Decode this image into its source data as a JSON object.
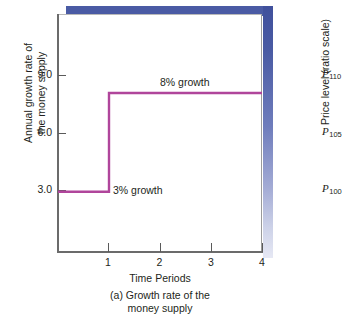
{
  "chart_data": {
    "type": "line",
    "title": "",
    "caption": "(a) Growth rate of the\nmoney supply",
    "caption_line1": "(a) Growth rate of the",
    "caption_line2": "money supply",
    "xlabel": "Time Periods",
    "ylabel_line1": "Annual growth rate of",
    "ylabel_line2": "the money supply",
    "ylabel": "Annual growth rate of the money supply",
    "right_axis_label": "Price level (ratio scale)",
    "xlim": [
      0,
      4
    ],
    "ylim": [
      0,
      12
    ],
    "grid": false,
    "legend": "none",
    "xticks": [
      "1",
      "2",
      "3",
      "4"
    ],
    "xtick_values": [
      1,
      2,
      3,
      4
    ],
    "yticks": [
      "3.0",
      "6.0",
      "9.0"
    ],
    "ytick_values": [
      3.0,
      6.0,
      9.0
    ],
    "series": [
      {
        "name": "Money supply growth rate",
        "color": "#b0459b",
        "x": [
          0,
          1,
          1,
          4
        ],
        "values": [
          3.0,
          3.0,
          8.0,
          8.0
        ],
        "step": true
      }
    ],
    "annotations": [
      {
        "text": "8% growth",
        "x": 2.0,
        "y": 8.6
      },
      {
        "text": "3% growth",
        "x": 1.15,
        "y": 3.0
      }
    ],
    "right_axis_ticks": [
      {
        "symbol": "P",
        "sub": "110",
        "y": 9.0
      },
      {
        "symbol": "P",
        "sub": "105",
        "y": 6.0
      },
      {
        "symbol": "P",
        "sub": "100",
        "y": 3.0
      }
    ],
    "colors": {
      "line": "#b0459b",
      "frame_accent": "#4a5ba4",
      "axis": "#6b6b6b",
      "text": "#231f20"
    }
  }
}
